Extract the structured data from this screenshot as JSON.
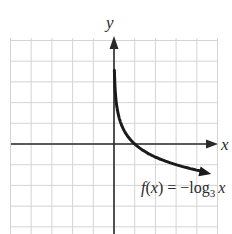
{
  "chart_data": {
    "type": "line",
    "title": "",
    "function_label": {
      "name": "f(x) = ",
      "minus": "−",
      "log": "log",
      "base": "3",
      "arg": "x"
    },
    "xlabel": "x",
    "ylabel": "y",
    "xlim": [
      -5,
      5
    ],
    "ylim": [
      -4.5,
      5
    ],
    "grid": true,
    "tick_labels": false,
    "series": [
      {
        "name": "f(x) = −log3 x",
        "x": [
          0.02,
          0.05,
          0.1,
          0.2,
          0.33,
          0.5,
          1,
          1.5,
          2,
          3,
          4.5
        ],
        "y": [
          3.56,
          2.73,
          2.1,
          1.46,
          1.0,
          0.63,
          0,
          -0.37,
          -0.63,
          -1.0,
          -1.37
        ]
      }
    ],
    "colors": {
      "grid": "#d4d4d4",
      "axis": "#2a2a2a",
      "curve": "#1a1a1a"
    }
  }
}
